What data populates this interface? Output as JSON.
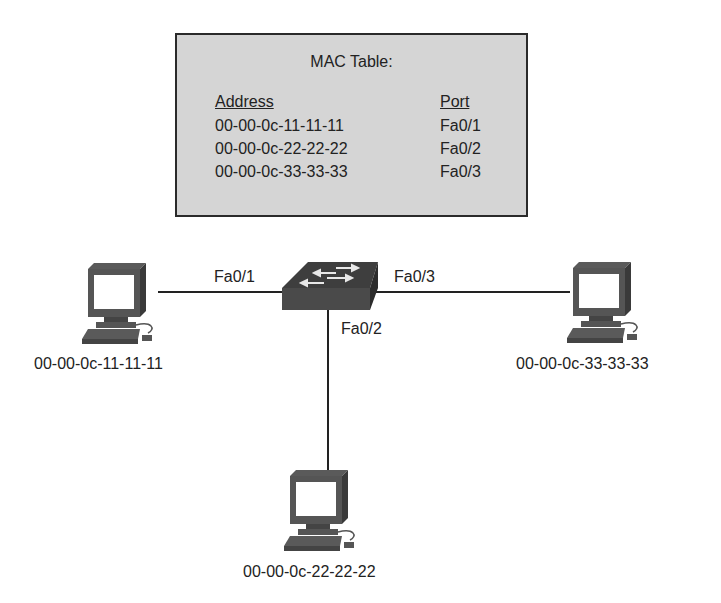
{
  "mac_table": {
    "title": "MAC Table:",
    "columns": [
      "Address",
      "Port"
    ],
    "rows": [
      {
        "address": "00-00-0c-11-11-11",
        "port": "Fa0/1"
      },
      {
        "address": "00-00-0c-22-22-22",
        "port": "Fa0/2"
      },
      {
        "address": "00-00-0c-33-33-33",
        "port": "Fa0/3"
      }
    ]
  },
  "switch": {
    "icon": "switch-icon",
    "ports": {
      "left": "Fa0/1",
      "bottom": "Fa0/2",
      "right": "Fa0/3"
    }
  },
  "hosts": [
    {
      "position": "left",
      "icon": "computer-icon",
      "mac": "00-00-0c-11-11-11"
    },
    {
      "position": "bottom",
      "icon": "computer-icon",
      "mac": "00-00-0c-22-22-22"
    },
    {
      "position": "right",
      "icon": "computer-icon",
      "mac": "00-00-0c-33-33-33"
    }
  ],
  "colors": {
    "table_bg": "#d5d5d5",
    "border": "#2a2a2a",
    "device": "#555555",
    "line": "#222222"
  }
}
